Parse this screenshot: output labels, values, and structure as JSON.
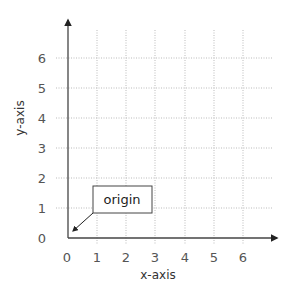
{
  "diagram": {
    "type": "coordinate-plane",
    "x_axis": {
      "title": "x-axis",
      "ticks": [
        "0",
        "1",
        "2",
        "3",
        "4",
        "5",
        "6"
      ]
    },
    "y_axis": {
      "title": "y-axis",
      "ticks": [
        "0",
        "1",
        "2",
        "3",
        "4",
        "5",
        "6"
      ]
    },
    "grid": {
      "style": "dotted",
      "color": "#bbbbbb"
    },
    "axis_color": "#444444",
    "callout": {
      "label": "origin",
      "points_to": [
        0,
        0
      ]
    }
  }
}
